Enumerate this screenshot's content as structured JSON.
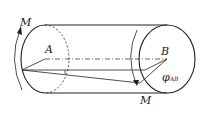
{
  "diagram": {
    "labels": {
      "moment_left": "M",
      "moment_right": "M",
      "point_a": "A",
      "point_b": "B",
      "angle_symbol": "φ",
      "angle_subscript": "AB"
    },
    "colors": {
      "stroke": "#222222",
      "background": "#ffffff"
    }
  }
}
